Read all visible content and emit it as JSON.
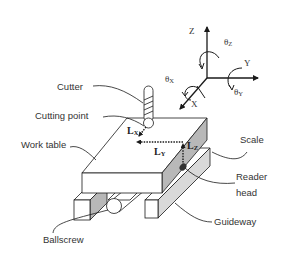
{
  "diagram": {
    "labels": {
      "cutter": "Cutter",
      "cutting_point": "Cutting point",
      "work_table": "Work table",
      "scale": "Scale",
      "reader_head_line1": "Reader",
      "reader_head_line2": "head",
      "guideway": "Guideway",
      "ballscrew": "Ballscrew"
    },
    "axes": {
      "z": "Z",
      "y": "Y",
      "x": "X",
      "theta": "θ",
      "theta_z_sub": "Z",
      "theta_x_sub": "X",
      "theta_y_sub": "Y"
    },
    "dimensions": {
      "l": "L",
      "lx_sub": "X",
      "ly_sub": "Y",
      "lz_sub": "Z"
    },
    "colors": {
      "line": "#1a1a1a",
      "shade": "#b8b8b8",
      "shade_light": "#d9d9d9",
      "text": "#333333",
      "reader": "#333333"
    }
  }
}
